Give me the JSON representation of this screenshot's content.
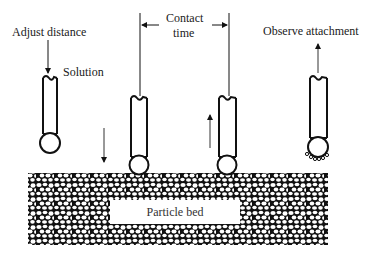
{
  "diagram": {
    "type": "process-schematic",
    "labels": {
      "adjust_distance": "Adjust distance",
      "solution": "Solution",
      "contact_time_line1": "Contact",
      "contact_time_line2": "time",
      "observe_attachment": "Observe attachment",
      "particle_bed": "Particle bed"
    },
    "steps": [
      {
        "id": 1,
        "state": "probe raised with solution droplet",
        "motion": "down"
      },
      {
        "id": 2,
        "state": "droplet contacts particle bed",
        "motion": "down"
      },
      {
        "id": 3,
        "state": "droplet withdrawn after contact time",
        "motion": "up"
      },
      {
        "id": 4,
        "state": "observe particles attached to droplet",
        "motion": "up"
      }
    ],
    "colors": {
      "ink": "#111111",
      "background": "#ffffff"
    }
  }
}
